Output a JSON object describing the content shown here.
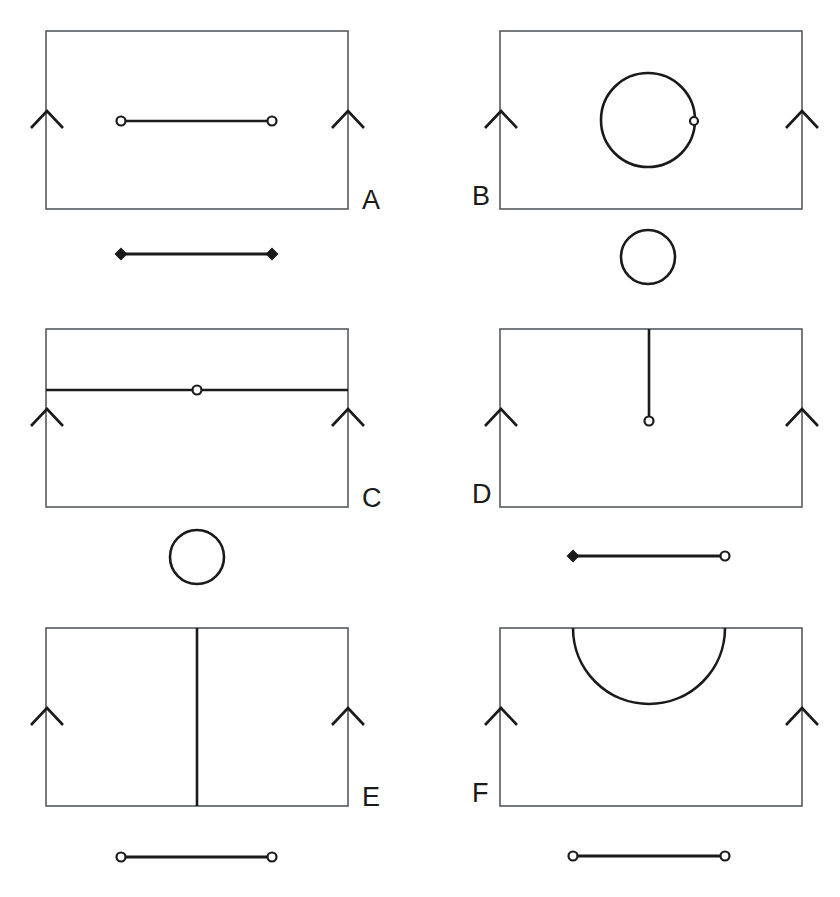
{
  "figure": {
    "background_color": "#ffffff",
    "stroke_color": "#1a1a1a",
    "frame_color": "#555a5e",
    "panel_count": 6
  },
  "panels": [
    {
      "id": "A",
      "label": "A",
      "label_position": "right",
      "frame": {
        "x": 46,
        "y": 31,
        "width": 302,
        "height": 178
      },
      "edge_marks": {
        "type": "chevron-up",
        "count": 2,
        "positions": [
          "left-edge",
          "right-edge"
        ],
        "apex_y": 112
      },
      "feature": {
        "type": "horizontal-segment",
        "description": "horizontal line inside frame with open-circle endpoints",
        "x1": 121,
        "y1": 121,
        "x2": 272,
        "y2": 121,
        "endpoint_start": "open-circle",
        "endpoint_end": "open-circle"
      },
      "legend": {
        "type": "segment",
        "description": "line segment with filled-diamond endpoints",
        "x1": 121,
        "y1": 254,
        "x2": 272,
        "y2": 254,
        "endpoint_start": "filled-diamond",
        "endpoint_end": "filled-diamond"
      }
    },
    {
      "id": "B",
      "label": "B",
      "label_position": "left",
      "frame": {
        "x": 500,
        "y": 31,
        "width": 302,
        "height": 178
      },
      "edge_marks": {
        "type": "chevron-up",
        "count": 2,
        "positions": [
          "left-edge",
          "right-edge"
        ],
        "apex_y": 112
      },
      "feature": {
        "type": "circle",
        "description": "large circle inside frame with open-circle marker on right rim",
        "cx": 648,
        "cy": 120,
        "r": 47,
        "marker": {
          "type": "open-circle",
          "cx": 694,
          "cy": 121
        }
      },
      "legend": {
        "type": "circle",
        "description": "small circle below frame",
        "cx": 648,
        "cy": 257,
        "r": 27
      }
    },
    {
      "id": "C",
      "label": "C",
      "label_position": "right",
      "frame": {
        "x": 46,
        "y": 329,
        "width": 302,
        "height": 178
      },
      "edge_marks": {
        "type": "chevron-up",
        "count": 2,
        "positions": [
          "left-edge",
          "right-edge"
        ],
        "apex_y": 410
      },
      "feature": {
        "type": "horizontal-line-full-width",
        "description": "horizontal line spanning full frame width with open-circle marker at centre",
        "x1": 46,
        "y1": 390,
        "x2": 348,
        "y2": 390,
        "marker": {
          "type": "open-circle",
          "cx": 197,
          "cy": 390
        }
      },
      "legend": {
        "type": "circle",
        "description": "circle below frame",
        "cx": 197,
        "cy": 557,
        "r": 27
      }
    },
    {
      "id": "D",
      "label": "D",
      "label_position": "left",
      "frame": {
        "x": 500,
        "y": 329,
        "width": 302,
        "height": 178
      },
      "edge_marks": {
        "type": "chevron-up",
        "count": 2,
        "positions": [
          "left-edge",
          "right-edge"
        ],
        "apex_y": 410
      },
      "feature": {
        "type": "vertical-segment",
        "description": "vertical line from top frame edge down to mid-height, open-circle terminus",
        "x1": 649,
        "y1": 329,
        "x2": 649,
        "y2": 420,
        "endpoint_end": "open-circle"
      },
      "legend": {
        "type": "segment",
        "description": "line segment with filled-diamond left end and open-circle right end",
        "x1": 573,
        "y1": 556,
        "x2": 725,
        "y2": 556,
        "endpoint_start": "filled-diamond",
        "endpoint_end": "open-circle"
      }
    },
    {
      "id": "E",
      "label": "E",
      "label_position": "right",
      "frame": {
        "x": 46,
        "y": 628,
        "width": 302,
        "height": 178
      },
      "edge_marks": {
        "type": "chevron-up",
        "count": 2,
        "positions": [
          "left-edge",
          "right-edge"
        ],
        "apex_y": 709
      },
      "feature": {
        "type": "vertical-line-full-height",
        "description": "vertical line spanning full frame height at centre",
        "x1": 197,
        "y1": 628,
        "x2": 197,
        "y2": 806
      },
      "legend": {
        "type": "segment",
        "description": "line segment with open-circle endpoints",
        "x1": 121,
        "y1": 857,
        "x2": 272,
        "y2": 857,
        "endpoint_start": "open-circle",
        "endpoint_end": "open-circle"
      }
    },
    {
      "id": "F",
      "label": "F",
      "label_position": "left",
      "frame": {
        "x": 500,
        "y": 628,
        "width": 302,
        "height": 178
      },
      "edge_marks": {
        "type": "chevron-up",
        "count": 2,
        "positions": [
          "left-edge",
          "right-edge"
        ],
        "apex_y": 709
      },
      "feature": {
        "type": "semicircular-arc",
        "description": "semicircle hanging downward from the top frame edge",
        "cx": 649,
        "cy": 628,
        "r": 76,
        "x_start": 573,
        "x_end": 725,
        "y_bottom": 704
      },
      "legend": {
        "type": "segment",
        "description": "line segment with open-circle endpoints",
        "x1": 573,
        "y1": 856,
        "x2": 725,
        "y2": 856,
        "endpoint_start": "open-circle",
        "endpoint_end": "open-circle"
      }
    }
  ],
  "markers": {
    "open_circle_radius": 4.5,
    "small_open_circle_radius": 4,
    "diamond_half_width": 5.5,
    "diamond_half_height": 5
  }
}
